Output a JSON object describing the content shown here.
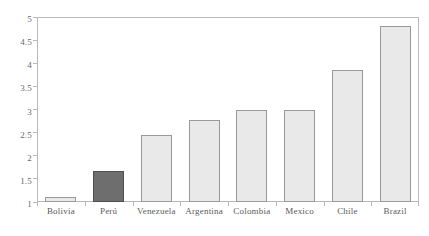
{
  "chart_data": {
    "type": "bar",
    "title": "",
    "subtitle": "",
    "xlabel": "",
    "ylabel": "",
    "ylim": [
      1,
      5
    ],
    "grid": false,
    "legend": null,
    "categories": [
      "Bolivia",
      "Perú",
      "Venezuela",
      "Argentina",
      "Colombia",
      "Mexico",
      "Chile",
      "Brazil"
    ],
    "values": [
      1.1,
      1.66,
      2.45,
      2.78,
      2.98,
      2.98,
      3.85,
      4.8
    ],
    "ytick_labels": [
      "5",
      "4.5",
      "4",
      "3.5",
      "3",
      "2.5",
      "2",
      "1.5",
      "1"
    ],
    "ytick_values": [
      5,
      4.5,
      4,
      3.5,
      3,
      2.5,
      2,
      1.5,
      1
    ],
    "highlight_category": "Perú",
    "series": [
      {
        "name": "value",
        "values": [
          1.1,
          1.66,
          2.45,
          2.78,
          2.98,
          2.98,
          3.85,
          4.8
        ]
      }
    ],
    "colors": {
      "bar_fill": "#e9e9e9",
      "bar_border": "#9a9a9a",
      "highlight_fill": "#6e6e6e",
      "highlight_border": "#4f4f4f",
      "axis": "#b9b9b9",
      "text": "#5a5a5a",
      "background": "#ffffff"
    }
  }
}
